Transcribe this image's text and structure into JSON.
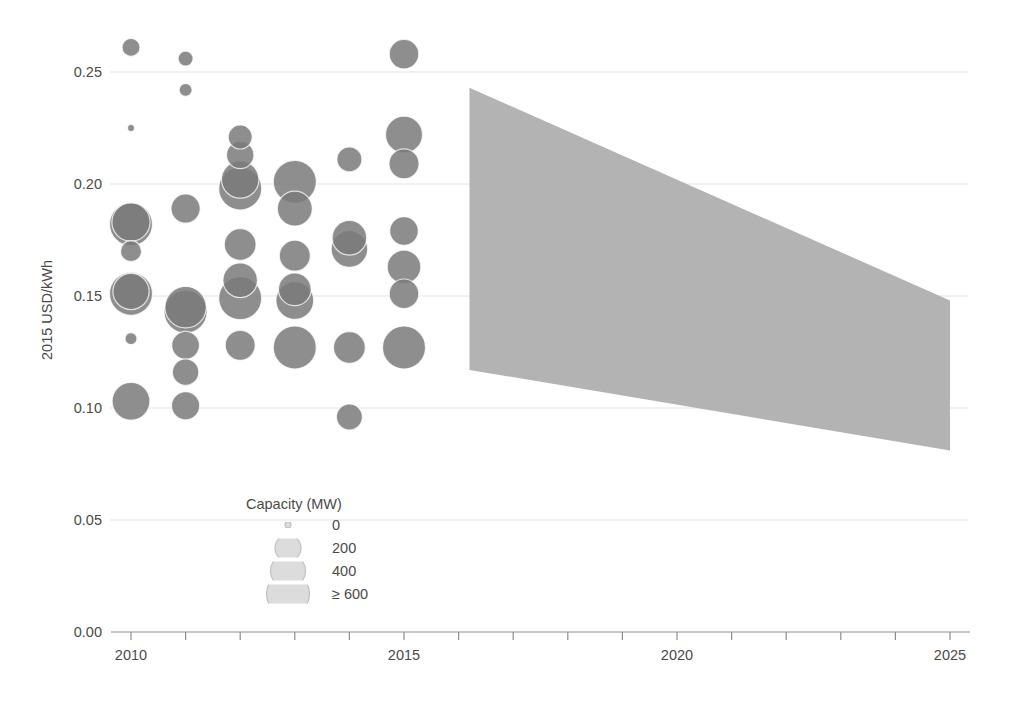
{
  "chart_data": {
    "type": "scatter",
    "title": "",
    "xlabel": "",
    "ylabel": "2015 USD/kWh",
    "xlim": [
      2009.4,
      2025.6
    ],
    "ylim": [
      0.0,
      0.27
    ],
    "grid": true,
    "x_ticks": [
      2010,
      2011,
      2012,
      2013,
      2014,
      2015,
      2016,
      2017,
      2018,
      2019,
      2020,
      2021,
      2022,
      2023,
      2024,
      2025
    ],
    "x_tick_labels": [
      "2010",
      "",
      "",
      "",
      "",
      "2015",
      "",
      "",
      "",
      "",
      "2020",
      "",
      "",
      "",
      "",
      "2025"
    ],
    "y_ticks": [
      0.0,
      0.05,
      0.1,
      0.15,
      0.2,
      0.25
    ],
    "y_tick_labels": [
      "0.00",
      "0.05",
      "0.10",
      "0.15",
      "0.20",
      "0.25"
    ],
    "bubble_color": "#7a7a7a",
    "bubble_opacity": 0.85,
    "band_color": "#b3b3b3",
    "gridline_color": "#e2e2e2",
    "axis_color": "#8c8c8c",
    "size_encoding": {
      "field": "Capacity (MW)",
      "breaks": [
        0,
        200,
        400,
        600
      ],
      "radius_px": [
        3.0,
        13.0,
        17.5,
        21.5
      ]
    },
    "series": [
      {
        "name": "Projects",
        "points": [
          {
            "year": 2010,
            "value": 0.261,
            "capacity": 120
          },
          {
            "year": 2010,
            "value": 0.225,
            "capacity": 10
          },
          {
            "year": 2010,
            "value": 0.183,
            "capacity": 480
          },
          {
            "year": 2010,
            "value": 0.182,
            "capacity": 620
          },
          {
            "year": 2010,
            "value": 0.17,
            "capacity": 150
          },
          {
            "year": 2010,
            "value": 0.152,
            "capacity": 430
          },
          {
            "year": 2010,
            "value": 0.151,
            "capacity": 610
          },
          {
            "year": 2010,
            "value": 0.131,
            "capacity": 60
          },
          {
            "year": 2010,
            "value": 0.103,
            "capacity": 470
          },
          {
            "year": 2011,
            "value": 0.256,
            "capacity": 90
          },
          {
            "year": 2011,
            "value": 0.242,
            "capacity": 70
          },
          {
            "year": 2011,
            "value": 0.189,
            "capacity": 270
          },
          {
            "year": 2011,
            "value": 0.145,
            "capacity": 560
          },
          {
            "year": 2011,
            "value": 0.143,
            "capacity": 640
          },
          {
            "year": 2011,
            "value": 0.128,
            "capacity": 240
          },
          {
            "year": 2011,
            "value": 0.116,
            "capacity": 210
          },
          {
            "year": 2011,
            "value": 0.101,
            "capacity": 250
          },
          {
            "year": 2012,
            "value": 0.221,
            "capacity": 180
          },
          {
            "year": 2012,
            "value": 0.213,
            "capacity": 230
          },
          {
            "year": 2012,
            "value": 0.202,
            "capacity": 460
          },
          {
            "year": 2012,
            "value": 0.198,
            "capacity": 650
          },
          {
            "year": 2012,
            "value": 0.173,
            "capacity": 330
          },
          {
            "year": 2012,
            "value": 0.157,
            "capacity": 390
          },
          {
            "year": 2012,
            "value": 0.149,
            "capacity": 660
          },
          {
            "year": 2012,
            "value": 0.128,
            "capacity": 290
          },
          {
            "year": 2013,
            "value": 0.201,
            "capacity": 670
          },
          {
            "year": 2013,
            "value": 0.189,
            "capacity": 400
          },
          {
            "year": 2013,
            "value": 0.168,
            "capacity": 310
          },
          {
            "year": 2013,
            "value": 0.153,
            "capacity": 350
          },
          {
            "year": 2013,
            "value": 0.148,
            "capacity": 470
          },
          {
            "year": 2013,
            "value": 0.127,
            "capacity": 680
          },
          {
            "year": 2014,
            "value": 0.211,
            "capacity": 190
          },
          {
            "year": 2014,
            "value": 0.176,
            "capacity": 390
          },
          {
            "year": 2014,
            "value": 0.171,
            "capacity": 440
          },
          {
            "year": 2014,
            "value": 0.127,
            "capacity": 330
          },
          {
            "year": 2014,
            "value": 0.096,
            "capacity": 200
          },
          {
            "year": 2015,
            "value": 0.258,
            "capacity": 280
          },
          {
            "year": 2015,
            "value": 0.222,
            "capacity": 450
          },
          {
            "year": 2015,
            "value": 0.209,
            "capacity": 290
          },
          {
            "year": 2015,
            "value": 0.179,
            "capacity": 260
          },
          {
            "year": 2015,
            "value": 0.163,
            "capacity": 370
          },
          {
            "year": 2015,
            "value": 0.151,
            "capacity": 280
          },
          {
            "year": 2015,
            "value": 0.127,
            "capacity": 700
          }
        ]
      }
    ],
    "projection_band": {
      "label": "",
      "x_start": 2016.2,
      "x_end": 2025.0,
      "upper_start": 0.243,
      "upper_end": 0.148,
      "lower_start": 0.117,
      "lower_end": 0.081
    }
  },
  "legend": {
    "title": "Capacity (MW)",
    "entries": [
      {
        "label": "0",
        "radius": 3.0
      },
      {
        "label": "200",
        "radius": 13.0
      },
      {
        "label": "400",
        "radius": 17.5
      },
      {
        "label": "≥ 600",
        "radius": 21.5
      }
    ]
  }
}
